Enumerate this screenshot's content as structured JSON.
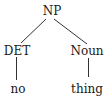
{
  "tree": {
    "root": {
      "label": "NP"
    },
    "children": [
      {
        "label": "DET",
        "leaf": "no"
      },
      {
        "label": "Noun",
        "leaf": "thing"
      }
    ]
  },
  "colors": {
    "text": "#1a1a1a",
    "edge": "#333333",
    "background": "#ffffff"
  }
}
